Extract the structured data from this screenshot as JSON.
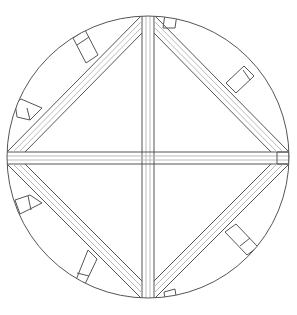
{
  "diagram": {
    "type": "technical-line-drawing",
    "colors": {
      "background": "#ffffff",
      "stroke": "#555555",
      "light_stroke": "#b0b0b0"
    },
    "circle": {
      "cx": 148,
      "cy": 157,
      "r": 141
    },
    "elements": [
      "outer-circle",
      "vertical-beam",
      "horizontal-beam",
      "diamond-beam-nw",
      "diamond-beam-ne",
      "diamond-beam-sw",
      "diamond-beam-se",
      "struts"
    ]
  }
}
